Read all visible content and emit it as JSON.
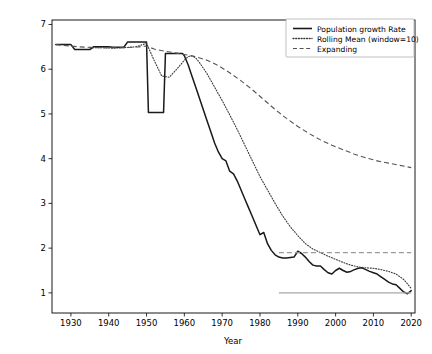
{
  "chart_data": {
    "type": "line",
    "title": "",
    "xlabel": "Year",
    "ylabel": "",
    "xlim": [
      1925,
      2021
    ],
    "ylim": [
      0.55,
      7.1
    ],
    "grid": false,
    "legend_position": "upper right",
    "xticks": [
      1930,
      1940,
      1950,
      1960,
      1970,
      1980,
      1990,
      2000,
      2010,
      2020
    ],
    "yticks": [
      1,
      2,
      3,
      4,
      5,
      6,
      7
    ],
    "legend": [
      "Population growth Rate",
      "Rolling Mean (window=10)",
      "Expanding"
    ],
    "series": [
      {
        "name": "Population growth Rate",
        "style": "solid",
        "color": "#1a1a1a",
        "x": [
          1926,
          1930,
          1931,
          1935,
          1936,
          1940,
          1941,
          1944,
          1945,
          1949,
          1950,
          1950.5,
          1954,
          1954.5,
          1955,
          1959,
          1959.5,
          1960,
          1961,
          1962,
          1963,
          1964,
          1965,
          1966,
          1967,
          1968,
          1969,
          1970,
          1971,
          1972,
          1973,
          1974,
          1975,
          1976,
          1977,
          1978,
          1979,
          1980,
          1981,
          1982,
          1983,
          1984,
          1985,
          1986,
          1987,
          1988,
          1989,
          1990,
          1991,
          1992,
          1993,
          1994,
          1995,
          1996,
          1997,
          1998,
          1999,
          2000,
          2001,
          2002,
          2003,
          2004,
          2005,
          2006,
          2007,
          2008,
          2009,
          2010,
          2011,
          2012,
          2013,
          2014,
          2015,
          2016,
          2017,
          2018,
          2019,
          2020
        ],
        "y": [
          6.55,
          6.55,
          6.44,
          6.44,
          6.5,
          6.5,
          6.49,
          6.49,
          6.61,
          6.61,
          6.61,
          5.03,
          5.03,
          5.03,
          6.35,
          6.35,
          6.35,
          6.3,
          6.1,
          5.85,
          5.6,
          5.35,
          5.1,
          4.85,
          4.6,
          4.35,
          4.15,
          4.0,
          3.95,
          3.72,
          3.66,
          3.5,
          3.3,
          3.1,
          2.9,
          2.7,
          2.5,
          2.3,
          2.35,
          2.1,
          1.95,
          1.85,
          1.8,
          1.78,
          1.78,
          1.79,
          1.8,
          1.93,
          1.88,
          1.8,
          1.7,
          1.62,
          1.6,
          1.6,
          1.52,
          1.45,
          1.42,
          1.5,
          1.55,
          1.5,
          1.46,
          1.48,
          1.52,
          1.55,
          1.56,
          1.52,
          1.48,
          1.45,
          1.42,
          1.36,
          1.3,
          1.24,
          1.2,
          1.18,
          1.1,
          1.02,
          0.98,
          1.05
        ]
      },
      {
        "name": "Rolling Mean (window=10)",
        "style": "dotted",
        "color": "#3a3a3a",
        "x": [
          1935,
          1938,
          1941,
          1944,
          1947,
          1949,
          1950,
          1952,
          1954,
          1956,
          1958,
          1960,
          1961,
          1962,
          1963,
          1964,
          1966,
          1968,
          1970,
          1972,
          1974,
          1976,
          1978,
          1980,
          1982,
          1984,
          1986,
          1988,
          1990,
          1992,
          1994,
          1996,
          1998,
          2000,
          2002,
          2004,
          2006,
          2008,
          2010,
          2012,
          2014,
          2016,
          2018,
          2020
        ],
        "y": [
          6.48,
          6.48,
          6.47,
          6.48,
          6.5,
          6.55,
          6.58,
          6.2,
          5.85,
          5.82,
          6.0,
          6.2,
          6.28,
          6.3,
          6.25,
          6.15,
          5.9,
          5.6,
          5.3,
          4.98,
          4.65,
          4.3,
          3.95,
          3.6,
          3.3,
          3.0,
          2.72,
          2.48,
          2.28,
          2.1,
          1.98,
          1.9,
          1.82,
          1.75,
          1.68,
          1.62,
          1.58,
          1.56,
          1.55,
          1.52,
          1.48,
          1.42,
          1.3,
          1.1
        ]
      },
      {
        "name": "Expanding",
        "style": "dashed",
        "color": "#555555",
        "x": [
          1926,
          1932,
          1938,
          1944,
          1948,
          1950,
          1952,
          1955,
          1958,
          1960,
          1963,
          1966,
          1969,
          1972,
          1975,
          1978,
          1981,
          1984,
          1987,
          1990,
          1993,
          1996,
          1999,
          2002,
          2005,
          2008,
          2011,
          2014,
          2017,
          2020
        ],
        "y": [
          6.55,
          6.5,
          6.48,
          6.48,
          6.5,
          6.52,
          6.45,
          6.4,
          6.36,
          6.33,
          6.28,
          6.2,
          6.08,
          5.92,
          5.74,
          5.54,
          5.32,
          5.1,
          4.9,
          4.72,
          4.56,
          4.42,
          4.3,
          4.2,
          4.1,
          4.02,
          3.95,
          3.9,
          3.85,
          3.8
        ]
      },
      {
        "name": "expanding-horizontal-reference",
        "style": "dashed",
        "color": "#9a9a9a",
        "x": [
          1985,
          2020
        ],
        "y": [
          1.9,
          1.9
        ]
      },
      {
        "name": "baseline-reference",
        "style": "solid",
        "color": "#a8a8a8",
        "x": [
          1985,
          2020
        ],
        "y": [
          1.0,
          1.0
        ]
      }
    ]
  },
  "axes": {
    "xlabel": "Year",
    "xtick_labels": [
      "1930",
      "1940",
      "1950",
      "1960",
      "1970",
      "1980",
      "1990",
      "2000",
      "2010",
      "2020"
    ],
    "ytick_labels": [
      "1",
      "2",
      "3",
      "4",
      "5",
      "6",
      "7"
    ]
  },
  "legend": {
    "items": [
      {
        "label": "Population growth Rate",
        "style": "solid"
      },
      {
        "label": "Rolling Mean (window=10)",
        "style": "dotted"
      },
      {
        "label": "Expanding",
        "style": "dashed"
      }
    ]
  }
}
